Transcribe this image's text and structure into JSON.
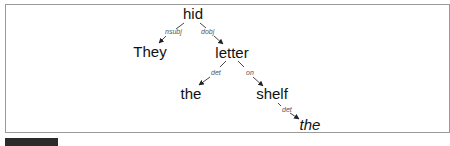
{
  "diagram": {
    "type": "dependency-tree",
    "nodes": [
      {
        "id": "n0",
        "label": "hid",
        "x": 193,
        "y": 19,
        "italic": false
      },
      {
        "id": "n1",
        "label": "They",
        "x": 150,
        "y": 57,
        "italic": false
      },
      {
        "id": "n2",
        "label": "letter",
        "x": 232,
        "y": 57,
        "italic": false
      },
      {
        "id": "n3",
        "label": "the",
        "x": 191,
        "y": 99,
        "italic": false
      },
      {
        "id": "n4",
        "label": "shelf",
        "x": 272,
        "y": 99,
        "italic": false
      },
      {
        "id": "n5",
        "label": "the",
        "x": 310,
        "y": 130,
        "italic": true
      }
    ],
    "edges": [
      {
        "from": "n0",
        "to": "n1",
        "relation": "nsubj"
      },
      {
        "from": "n0",
        "to": "n2",
        "relation": "dobj"
      },
      {
        "from": "n2",
        "to": "n3",
        "relation": "det"
      },
      {
        "from": "n2",
        "to": "n4",
        "relation": "on"
      },
      {
        "from": "n4",
        "to": "n5",
        "relation": "det"
      }
    ]
  },
  "caption": {
    "label": "",
    "text": ""
  },
  "colors": {
    "frame_border": "#9a9a9a",
    "edge": "#333333",
    "word": "#111111",
    "relation": "#555555",
    "caption_box": "#2b2b2b"
  }
}
